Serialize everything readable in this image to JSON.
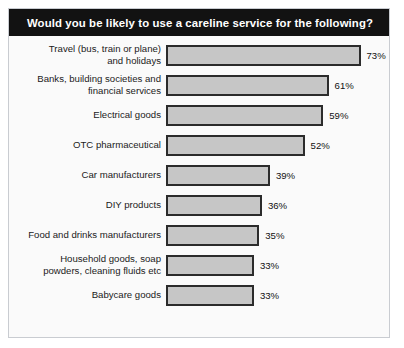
{
  "chart_data": {
    "type": "bar",
    "orientation": "horizontal",
    "title": "Would you be likely to use a careline service for the following?",
    "xlabel": "",
    "ylabel": "",
    "xlim": [
      0,
      100
    ],
    "grid": false,
    "legend": null,
    "value_suffix": "%",
    "categories": [
      "Travel (bus, train or plane)\nand holidays",
      "Banks, building societies and\nfinancial services",
      "Electrical goods",
      "OTC pharmaceutical",
      "Car manufacturers",
      "DIY products",
      "Food and drinks manufacturers",
      "Household goods, soap\npowders, cleaning fluids etc",
      "Babycare goods"
    ],
    "values": [
      73,
      61,
      59,
      52,
      39,
      36,
      35,
      33,
      33
    ],
    "value_labels": [
      "73%",
      "61%",
      "59%",
      "52%",
      "39%",
      "36%",
      "35%",
      "33%",
      "33%"
    ],
    "colors": {
      "bar_fill": "#c6c6c6",
      "bar_border": "#2b2b2b",
      "title_bar_background": "#121212",
      "title_text": "#ffffff",
      "plot_background": "#fafafa",
      "frame_border": "#c9ccd1"
    }
  }
}
